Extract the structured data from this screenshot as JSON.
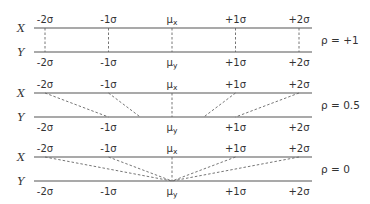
{
  "diagram": {
    "title": "",
    "x_axis_label": "X",
    "y_axis_label": "Y",
    "tick_labels_x": [
      "-2σ",
      "-1σ",
      "μx",
      "+1σ",
      "+2σ"
    ],
    "tick_labels_y": [
      "-2σ",
      "-1σ",
      "μy",
      "+1σ",
      "+2σ"
    ],
    "panels": [
      {
        "rho_label": "ρ = +1",
        "rho": 1,
        "mapping": [
          [
            -2,
            -2
          ],
          [
            -1,
            -1
          ],
          [
            0,
            0
          ],
          [
            1,
            1
          ],
          [
            2,
            2
          ]
        ],
        "connector_style": "dashed"
      },
      {
        "rho_label": "ρ = 0.5",
        "rho": 0.5,
        "mapping": [
          [
            -2,
            -1
          ],
          [
            -1,
            -0.5
          ],
          [
            0,
            0
          ],
          [
            1,
            0.5
          ],
          [
            2,
            1
          ]
        ],
        "connector_style": "dashed"
      },
      {
        "rho_label": "ρ = 0",
        "rho": 0,
        "mapping": [
          [
            -2,
            0
          ],
          [
            -1,
            0
          ],
          [
            0,
            0
          ],
          [
            1,
            0
          ],
          [
            2,
            0
          ]
        ],
        "connector_style": "dashed"
      }
    ]
  }
}
